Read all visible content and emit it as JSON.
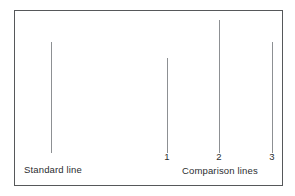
{
  "figure": {
    "background_color": "#ffffff",
    "border_color": "#56585a",
    "line_color": "#8d9093",
    "text_color": "#2b2d2f"
  },
  "captions": {
    "standard": "Standard line",
    "comparison": "Comparison lines"
  },
  "ticks": [
    {
      "label": "1"
    },
    {
      "label": "2"
    },
    {
      "label": "3"
    }
  ],
  "chart_data": {
    "type": "bar",
    "title": "",
    "subtitle": "",
    "xlabel": "",
    "ylabel": "",
    "orientation": "vertical",
    "grid": false,
    "legend": false,
    "categories": [
      "Standard line",
      "1",
      "2",
      "3"
    ],
    "values": [
      111,
      95,
      133,
      111
    ],
    "value_units": "px",
    "ylim": [
      0,
      143
    ],
    "baseline_y_px": 153,
    "bars": [
      {
        "name": "Standard line",
        "group": "standard",
        "tick_label": "",
        "x_px": 51,
        "top_px": 42,
        "bottom_px": 153,
        "height_px": 111,
        "color": "#8d9093",
        "width_px": 1
      },
      {
        "name": "Comparison line 1",
        "group": "comparison",
        "tick_label": "1",
        "x_px": 167,
        "top_px": 58,
        "bottom_px": 153,
        "height_px": 95,
        "color": "#8d9093",
        "width_px": 1
      },
      {
        "name": "Comparison line 2",
        "group": "comparison",
        "tick_label": "2",
        "x_px": 219,
        "top_px": 20,
        "bottom_px": 153,
        "height_px": 133,
        "color": "#8d9093",
        "width_px": 1
      },
      {
        "name": "Comparison line 3",
        "group": "comparison",
        "tick_label": "3",
        "x_px": 272,
        "top_px": 42,
        "bottom_px": 153,
        "height_px": 111,
        "color": "#8d9093",
        "width_px": 1
      }
    ],
    "annotations": [
      {
        "text": "Standard line",
        "x_px": 24,
        "y_px": 164
      },
      {
        "text": "Comparison lines",
        "x_px": 182,
        "y_px": 165
      }
    ]
  }
}
